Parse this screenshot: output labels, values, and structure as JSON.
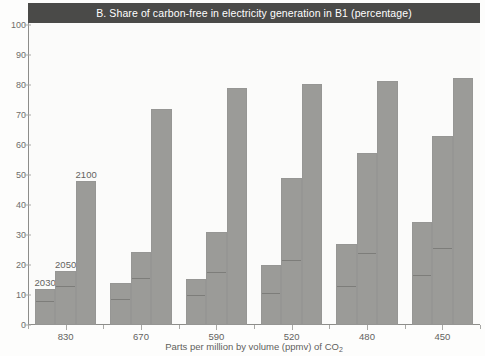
{
  "chart_data": {
    "type": "bar",
    "title": "B.  Share of carbon-free in electricity generation in B1 (percentage)",
    "xlabel": "Parts per million by volume (ppmv) of CO",
    "xlabel_sub": "2",
    "ylabel": "",
    "ylim": [
      0,
      100
    ],
    "ytick_step": 10,
    "yticks": [
      "0",
      "10",
      "20",
      "30",
      "40",
      "50",
      "60",
      "70",
      "80",
      "90",
      "100"
    ],
    "categories": [
      "830",
      "670",
      "590",
      "520",
      "480",
      "450"
    ],
    "series": [
      {
        "name": "2030",
        "values": [
          12,
          14,
          15.5,
          20,
          27,
          34.5
        ]
      },
      {
        "name": "2050",
        "values": [
          18,
          24.5,
          31,
          49,
          57.5,
          63
        ]
      },
      {
        "name": "2100",
        "values": [
          48,
          72,
          79,
          80.5,
          81.5,
          82.5
        ]
      }
    ],
    "series_labels_shown_on_group": "830",
    "inner_divider_values": [
      [
        7.5,
        8,
        9.5,
        10,
        12.5,
        16
      ],
      [
        12.5,
        15,
        17,
        21,
        23.5,
        25
      ],
      [
        0,
        0,
        0,
        0,
        0,
        0
      ]
    ],
    "grid": false,
    "legend": "inline-bar-labels",
    "bar_color": "#9b9b98",
    "title_bar_color": "#4a4a48",
    "axis_color": "#8d8d8a",
    "background": "#fbfbfa"
  }
}
